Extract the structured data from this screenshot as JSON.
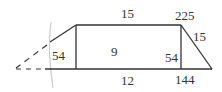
{
  "diagram": {
    "labels": {
      "top": "15",
      "bottom": "12",
      "left_triangle": "54",
      "rectangle": "9",
      "right_triangle": "54",
      "hypotenuse_top": "225",
      "hypotenuse_side": "15",
      "right_bottom": "144"
    },
    "colors": {
      "line": "#333333",
      "guide": "#cccccc"
    }
  }
}
